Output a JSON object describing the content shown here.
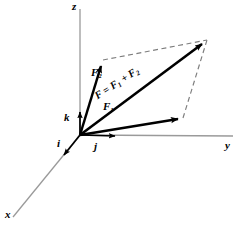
{
  "figure": {
    "background_color": "#ffffff",
    "axis_color": "#9a9a9a",
    "vector_color": "#000000",
    "dashed_color": "#7d7d7d"
  },
  "axes": [
    {
      "name": "z-axis",
      "label": "z",
      "from": [
        80,
        135
      ],
      "to": [
        80,
        9
      ]
    },
    {
      "name": "y-axis",
      "label": "y",
      "from": [
        80,
        135
      ],
      "to": [
        233,
        136
      ]
    },
    {
      "name": "x-axis",
      "label": "x",
      "from": [
        80,
        135
      ],
      "to": [
        13,
        217
      ]
    }
  ],
  "unit_vectors": [
    {
      "name": "k",
      "label": "k",
      "from": [
        80,
        135
      ],
      "to": [
        80,
        110
      ],
      "description": "unit vector along z"
    },
    {
      "name": "j",
      "label": "j",
      "from": [
        80,
        135
      ],
      "to": [
        118,
        136
      ],
      "description": "unit vector along y"
    },
    {
      "name": "i",
      "label": "i",
      "from": [
        80,
        135
      ],
      "to": [
        62,
        157
      ],
      "description": "unit vector along x"
    }
  ],
  "vectors": [
    {
      "name": "F1",
      "label": "F",
      "subscript": "1",
      "from": [
        80,
        135
      ],
      "to": [
        183,
        118
      ]
    },
    {
      "name": "F2",
      "label": "F",
      "subscript": "2",
      "from": [
        80,
        135
      ],
      "to": [
        103,
        60
      ]
    },
    {
      "name": "F",
      "label": "F = F",
      "subscript": "1",
      "label_mid": " + F",
      "subscript2": "2",
      "from": [
        80,
        135
      ],
      "to": [
        207,
        40
      ]
    }
  ],
  "dashed_edges": [
    {
      "name": "edge-F2-to-tip",
      "from": [
        103,
        60
      ],
      "to": [
        207,
        40
      ]
    },
    {
      "name": "edge-F1-to-tip",
      "from": [
        183,
        118
      ],
      "to": [
        207,
        40
      ]
    }
  ],
  "labels": {
    "z": "z",
    "y": "y",
    "x": "x",
    "k": "k",
    "j": "j",
    "i": "i",
    "f1_base": "F",
    "f1_sub": "1",
    "f2_base": "F",
    "f2_sub": "2",
    "resultant_part1": "F = F",
    "resultant_sub1": "1",
    "resultant_part2": " + F",
    "resultant_sub2": "2"
  }
}
